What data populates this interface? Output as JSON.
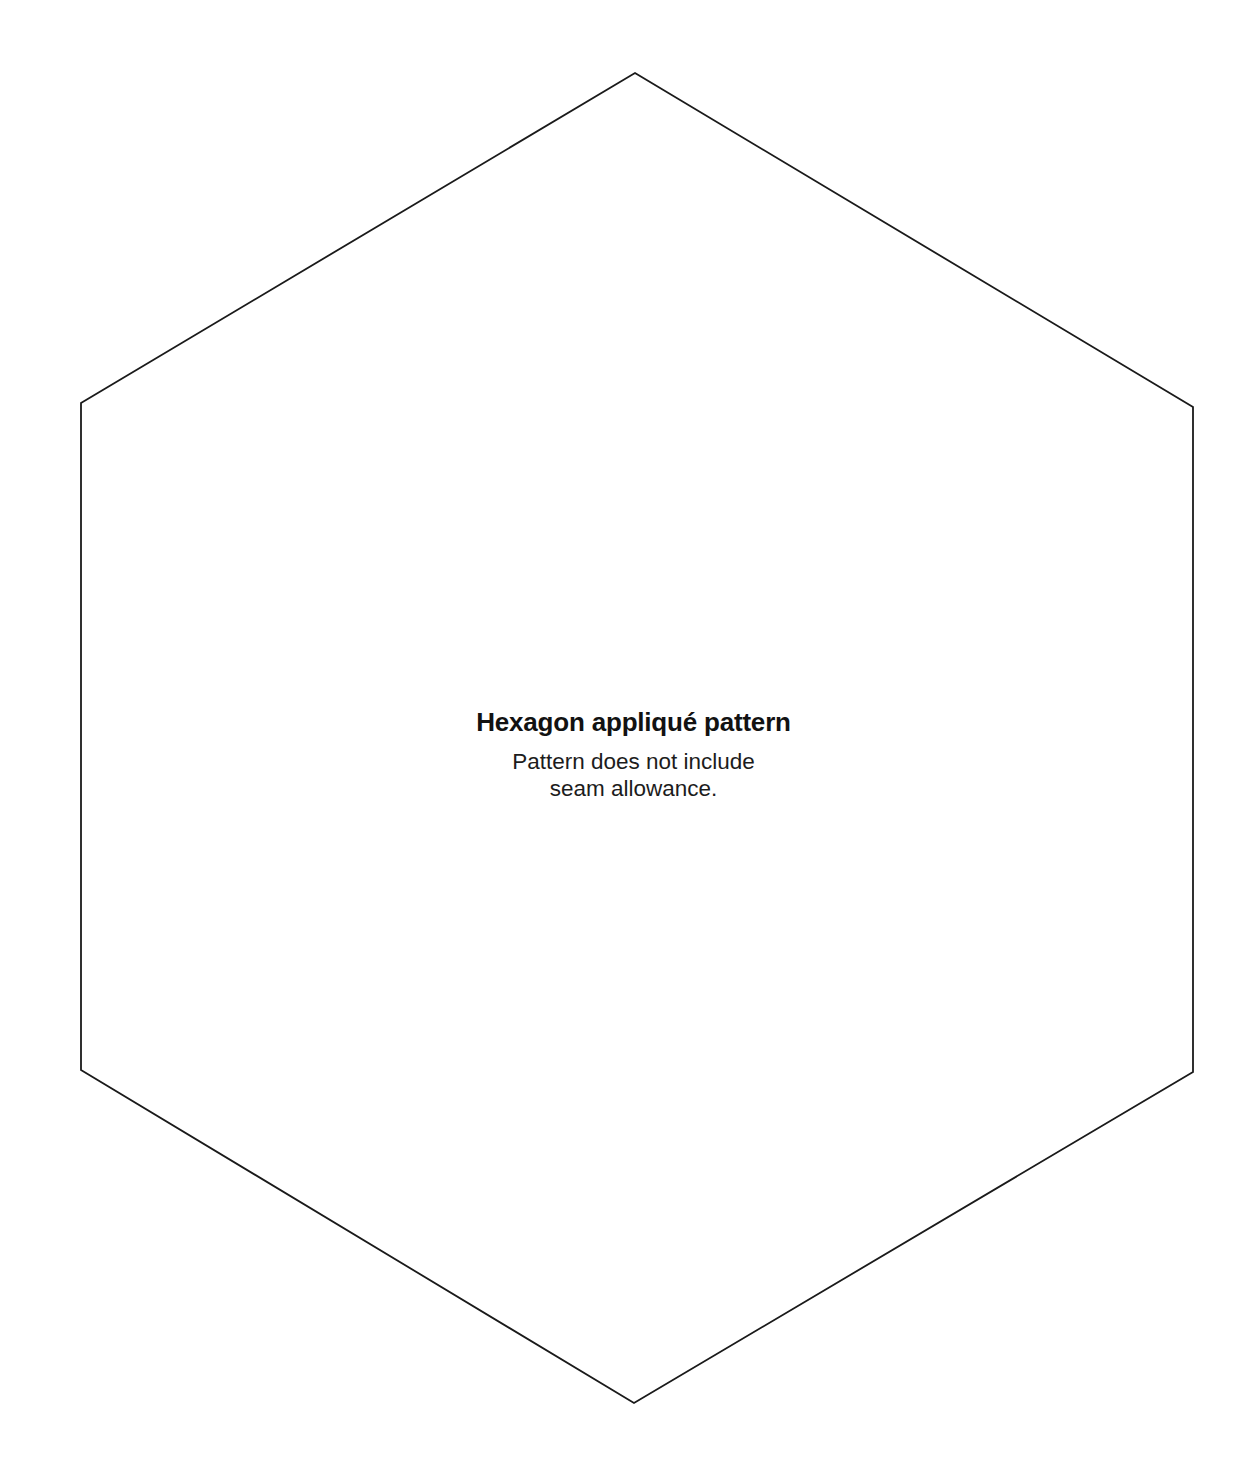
{
  "document": {
    "kind": "sewing-pattern-template",
    "background_color": "#ffffff",
    "width": 1257,
    "height": 1482
  },
  "shape": {
    "name": "hexagon",
    "icon": "hexagon-outline-icon",
    "stroke_color": "#1a1a1a",
    "stroke_width": 1.8,
    "fill": "none",
    "points": "635,73 1193,407 1193,1072 634,1403 81,1070 81,403",
    "vertices": [
      {
        "label": "top",
        "x": 635,
        "y": 73
      },
      {
        "label": "top-right",
        "x": 1193,
        "y": 407
      },
      {
        "label": "bottom-right",
        "x": 1193,
        "y": 1072
      },
      {
        "label": "bottom",
        "x": 634,
        "y": 1403
      },
      {
        "label": "bottom-left",
        "x": 81,
        "y": 1070
      },
      {
        "label": "top-left",
        "x": 81,
        "y": 403
      }
    ]
  },
  "labels": {
    "title": "Hexagon appliqué pattern",
    "note_line_1": "Pattern does not include",
    "note_line_2": "seam allowance."
  }
}
